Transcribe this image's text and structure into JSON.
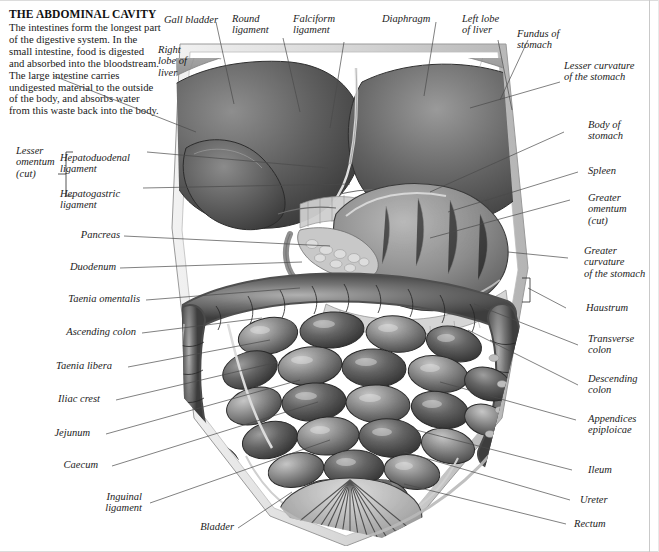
{
  "figure": {
    "title": "THE ABDOMINAL CAVITY",
    "body": "The intestines form the longest part of the digestive system. In the small intestine, food is digested and absorbed into the bloodstream. The large intestine carries undigested material to the outside of the body, and absorbs water from this waste back into the body.",
    "style": "grayscale-engraving"
  },
  "labels": {
    "top": [
      {
        "id": "gall-bladder",
        "text": "Gall bladder",
        "align": "right"
      },
      {
        "id": "round-ligament",
        "text": "Round\nligament",
        "align": "left"
      },
      {
        "id": "falciform-ligament",
        "text": "Falciform\nligament",
        "align": "left"
      },
      {
        "id": "diaphragm",
        "text": "Diaphragm",
        "align": "left"
      },
      {
        "id": "left-lobe-of-liver",
        "text": "Left lobe\nof liver",
        "align": "left"
      },
      {
        "id": "fundus-of-stomach",
        "text": "Fundus of\nstomach",
        "align": "left"
      }
    ],
    "left": [
      {
        "id": "right-lobe-of-liver",
        "text": "Right\nlobe of\nliver",
        "align": "left"
      },
      {
        "id": "lesser-omentum-cut",
        "text": "Lesser\nomentum\n(cut)",
        "align": "left"
      },
      {
        "id": "hepatoduodenal-ligament",
        "text": "Hepatoduodenal\nligament",
        "align": "left"
      },
      {
        "id": "hepatogastric-ligament",
        "text": "Hepatogastric\nligament",
        "align": "left"
      },
      {
        "id": "pancreas",
        "text": "Pancreas",
        "align": "right"
      },
      {
        "id": "duodenum",
        "text": "Duodenum",
        "align": "right"
      },
      {
        "id": "taenia-omentalis",
        "text": "Taenia omentalis",
        "align": "right"
      },
      {
        "id": "ascending-colon",
        "text": "Ascending colon",
        "align": "right"
      },
      {
        "id": "taenia-libera",
        "text": "Taenia libera",
        "align": "right"
      },
      {
        "id": "iliac-crest",
        "text": "Iliac crest",
        "align": "right"
      },
      {
        "id": "jejunum",
        "text": "Jejunum",
        "align": "right"
      },
      {
        "id": "caecum",
        "text": "Caecum",
        "align": "right"
      },
      {
        "id": "inguinal-ligament",
        "text": "Inguinal\nligament",
        "align": "right"
      },
      {
        "id": "bladder",
        "text": "Bladder",
        "align": "right"
      }
    ],
    "right": [
      {
        "id": "lesser-curvature-of-the-stomach",
        "text": "Lesser curvature\nof the stomach",
        "align": "left"
      },
      {
        "id": "body-of-stomach",
        "text": "Body of\nstomach",
        "align": "left"
      },
      {
        "id": "spleen",
        "text": "Spleen",
        "align": "left"
      },
      {
        "id": "greater-omentum-cut",
        "text": "Greater\nomentum\n(cut)",
        "align": "left"
      },
      {
        "id": "greater-curvature-of-the-stomach",
        "text": "Greater\ncurvature\nof the stomach",
        "align": "left"
      },
      {
        "id": "haustrum",
        "text": "Haustrum",
        "align": "left"
      },
      {
        "id": "transverse-colon",
        "text": "Transverse\ncolon",
        "align": "left"
      },
      {
        "id": "descending-colon",
        "text": "Descending\ncolon",
        "align": "left"
      },
      {
        "id": "appendices-epiploicae",
        "text": "Appendices\nepiploicae",
        "align": "left"
      },
      {
        "id": "ileum",
        "text": "Ileum",
        "align": "left"
      },
      {
        "id": "ureter",
        "text": "Ureter",
        "align": "left"
      },
      {
        "id": "rectum",
        "text": "Rectum",
        "align": "left"
      }
    ]
  },
  "colors": {
    "page_background": "#ffffff",
    "text": "#1c1c1c",
    "leader_line": "#4a4a4a",
    "frame": "#c9c9c9",
    "art_dark": "#3a3a3a",
    "art_mid": "#8a8a8a",
    "art_light": "#d8d8d8"
  }
}
